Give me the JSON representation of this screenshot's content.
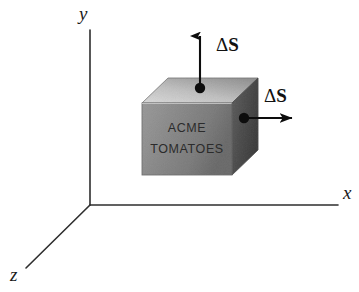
{
  "figure": {
    "title": "",
    "type": "3d-vector-diagram",
    "background_color": "#ffffff"
  },
  "axes": {
    "y": {
      "label": "y",
      "origin": [
        90,
        205
      ],
      "tip": [
        90,
        30
      ],
      "label_pos": [
        79,
        20
      ]
    },
    "x": {
      "label": "x",
      "origin": [
        90,
        205
      ],
      "tip": [
        338,
        205
      ],
      "label_pos": [
        343,
        199
      ]
    },
    "z": {
      "label": "z",
      "origin": [
        90,
        205
      ],
      "tip": [
        26,
        268
      ],
      "label_pos": [
        10,
        280
      ]
    },
    "line_color": "#2e2e2e"
  },
  "box": {
    "front_label_line1": "ACME",
    "front_label_line2": "TOMATOES",
    "front_face_color": "#b8b8b8",
    "top_face_color": "#d8d8d8",
    "right_face_color": "#8e8e8e",
    "edge_color": "#9a9a9a",
    "front": {
      "x": 142,
      "y": 103,
      "w": 90,
      "h": 72
    },
    "depth": [
      26,
      -25
    ]
  },
  "vectors": [
    {
      "name": "top-surface-normal",
      "label_delta": "Δ",
      "label_symbol": "S",
      "dot": [
        200,
        88
      ],
      "tip": [
        200,
        33
      ],
      "label_pos": [
        216,
        50
      ],
      "color": "#0d0d0d"
    },
    {
      "name": "right-surface-normal",
      "label_delta": "Δ",
      "label_symbol": "S",
      "dot": [
        244,
        118
      ],
      "tip": [
        296,
        118
      ],
      "label_pos": [
        264,
        101
      ],
      "color": "#0d0d0d"
    }
  ]
}
